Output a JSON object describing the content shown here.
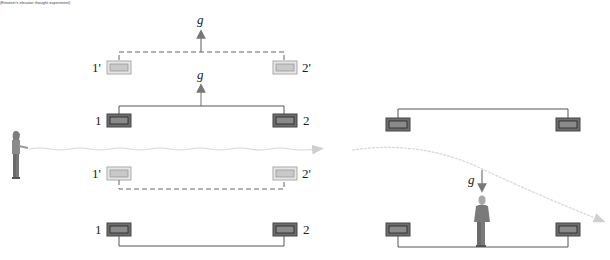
{
  "caption": "(Einstein's elevator thought experiment)",
  "left_panel": {
    "upper_group": {
      "primed_clocks": {
        "left_label": "1'",
        "right_label": "2'",
        "style": "dashed"
      },
      "unprimed_clocks": {
        "left_label": "1",
        "right_label": "2",
        "style": "solid"
      },
      "gravity_label_primed": "g",
      "gravity_label_unprimed": "g",
      "gravity_direction": "up"
    },
    "lower_group": {
      "primed_clocks": {
        "left_label": "1'",
        "right_label": "2'",
        "style": "dashed"
      },
      "unprimed_clocks": {
        "left_label": "1",
        "right_label": "2",
        "style": "solid"
      }
    },
    "observer": "person-emitting-light",
    "light_beam": "straight"
  },
  "right_panel": {
    "gravity_label": "g",
    "gravity_direction": "down",
    "observer": "standing-person",
    "light_beam": "curved-downward"
  },
  "colors": {
    "clock_dark": "#6e6e6e",
    "clock_light": "#c8c8c8",
    "line": "#555555",
    "beam": "#d8d8d8",
    "arrow": "#777777"
  }
}
